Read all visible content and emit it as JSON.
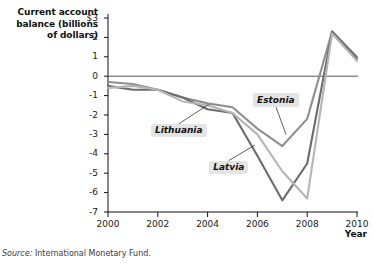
{
  "chart_data": {
    "type": "line",
    "title": "Current account balance (billions of dollars)",
    "ylabel": "Current account balance (billions of dollars)",
    "xlabel": "Year",
    "xlim": [
      2000,
      2010
    ],
    "ylim": [
      -7,
      3
    ],
    "ytick_labels": [
      "$3",
      "2",
      "1",
      "0",
      "-1",
      "-2",
      "-3",
      "-4",
      "-5",
      "-6",
      "-7"
    ],
    "ytick_values": [
      3,
      2,
      1,
      0,
      -1,
      -2,
      -3,
      -4,
      -5,
      -6,
      -7
    ],
    "xtick_labels": [
      "2000",
      "2002",
      "2004",
      "2006",
      "2008",
      "2010"
    ],
    "xtick_values": [
      2000,
      2002,
      2004,
      2006,
      2008,
      2010
    ],
    "grid": false,
    "legend": "inline-annotations",
    "x": [
      2000,
      2001,
      2002,
      2003,
      2004,
      2005,
      2006,
      2007,
      2008,
      2009,
      2010
    ],
    "series": [
      {
        "name": "Estonia",
        "color": "#8f8f8f",
        "values": [
          -0.3,
          -0.4,
          -0.7,
          -1.1,
          -1.4,
          -1.6,
          -2.7,
          -3.6,
          -2.2,
          2.3,
          1.0
        ]
      },
      {
        "name": "Latvia",
        "color": "#6b6b6b",
        "values": [
          -0.5,
          -0.7,
          -0.7,
          -1.1,
          -1.7,
          -1.9,
          -4.1,
          -6.4,
          -4.5,
          2.3,
          0.9
        ]
      },
      {
        "name": "Lithuania",
        "color": "#b5b5b5",
        "values": [
          -0.6,
          -0.5,
          -0.7,
          -1.3,
          -1.5,
          -1.9,
          -3.0,
          -4.9,
          -6.3,
          2.2,
          0.8
        ]
      }
    ],
    "annotations": [
      {
        "label": "Lithuania",
        "leader_from": [
          2004.05,
          -1.45
        ],
        "leader_to": [
          2002.85,
          -2.45
        ]
      },
      {
        "label": "Latvia",
        "leader_from": [
          2005.9,
          -3.55
        ],
        "leader_to": [
          2004.85,
          -4.35
        ]
      },
      {
        "label": "Estonia",
        "leader_from": [
          2007.15,
          -3.0
        ],
        "leader_to": [
          2006.75,
          -1.6
        ]
      }
    ],
    "source": "Source: International Monetary Fund.",
    "source_prefix": "Source:",
    "source_text": "International Monetary Fund."
  },
  "axis": {
    "y_title_line1": "Current account",
    "y_title_line2": "balance (billions",
    "y_title_line3": "of dollars)",
    "x_title": "Year"
  },
  "colors": {
    "estonia": "#8f8f8f",
    "latvia": "#6b6b6b",
    "lithuania": "#b5b5b5",
    "axis": "#111111",
    "label_bg": "#e4e4e4"
  }
}
